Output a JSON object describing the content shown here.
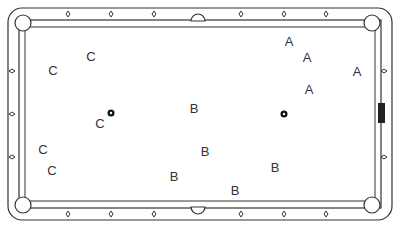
{
  "diagram": {
    "type": "pool-table",
    "labels": [
      {
        "text": "C",
        "x": 53,
        "y": 70
      },
      {
        "text": "C",
        "x": 91,
        "y": 56
      },
      {
        "text": "C",
        "x": 100,
        "y": 123
      },
      {
        "text": "C",
        "x": 43,
        "y": 149
      },
      {
        "text": "C",
        "x": 52,
        "y": 170
      },
      {
        "text": "B",
        "x": 194,
        "y": 108
      },
      {
        "text": "B",
        "x": 205,
        "y": 151
      },
      {
        "text": "B",
        "x": 174,
        "y": 176
      },
      {
        "text": "B",
        "x": 275,
        "y": 167
      },
      {
        "text": "B",
        "x": 235,
        "y": 190
      },
      {
        "text": "A",
        "x": 289,
        "y": 41
      },
      {
        "text": "A",
        "x": 307,
        "y": 57
      },
      {
        "text": "A",
        "x": 357,
        "y": 71
      },
      {
        "text": "A",
        "x": 309,
        "y": 89
      }
    ],
    "balls": [
      {
        "name": "ball-left",
        "x": 111,
        "y": 113
      },
      {
        "name": "ball-right",
        "x": 284,
        "y": 114
      }
    ],
    "marker": {
      "name": "right-rail-marker",
      "x": 380,
      "y": 103,
      "w": 7,
      "h": 20
    }
  }
}
